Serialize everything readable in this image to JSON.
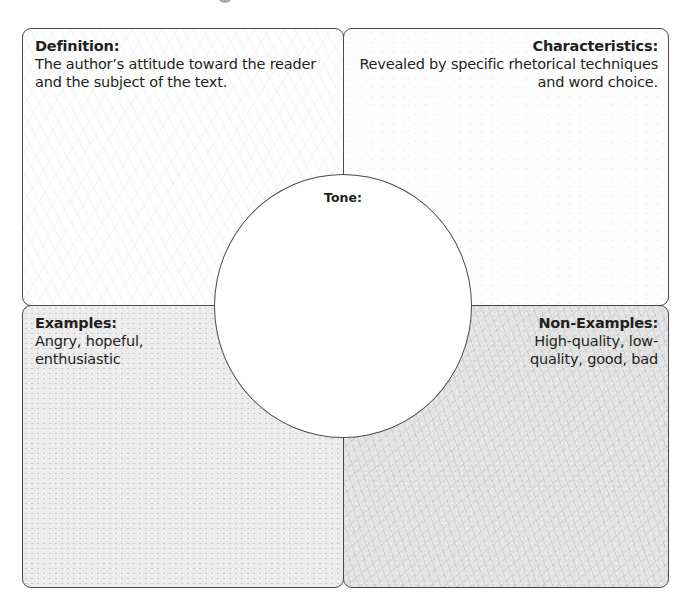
{
  "organizer": {
    "type": "Frayer model",
    "center": {
      "label": "Tone:",
      "value": ""
    },
    "quadrants": {
      "definition": {
        "heading": "Definition:",
        "body": "The author’s attitude toward the reader and the subject of the text."
      },
      "characteristics": {
        "heading": "Characteristics:",
        "body": "Revealed by specific rhetorical techniques and word choice."
      },
      "examples": {
        "heading": "Examples:",
        "body": "Angry, hopeful, enthusiastic"
      },
      "non_examples": {
        "heading": "Non-Examples:",
        "body": "High-quality, low-quality, good, bad"
      }
    }
  },
  "colors": {
    "border": "#4a4a4a",
    "text": "#231f20",
    "definition_fill": "#fdfdfd",
    "characteristics_fill": "#fdfdfd",
    "examples_fill": "#ececec",
    "non_examples_fill": "#e2e2e2",
    "circle_fill": "#ffffff"
  }
}
